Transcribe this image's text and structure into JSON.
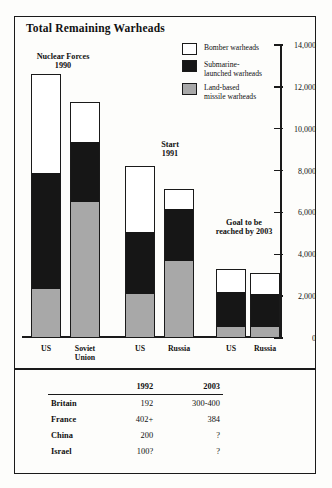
{
  "title": "Total Remaining Warheads",
  "legend": [
    {
      "key": "bomber",
      "label": "Bomber warheads",
      "swatch": "white",
      "color": "#ffffff"
    },
    {
      "key": "submarine",
      "label": "Submarine-\nlaunched warheads",
      "line1": "Submarine-",
      "line2": "launched warheads",
      "swatch": "black",
      "color": "#161616"
    },
    {
      "key": "landbased",
      "label": "Land-based\nmissile warheads",
      "line1": "Land-based",
      "line2": "missile warheads",
      "swatch": "gray",
      "color": "#a8a8a8"
    }
  ],
  "group_labels": [
    {
      "line1": "Nuclear Forces",
      "line2": "1990"
    },
    {
      "line1": "Start",
      "line2": "1991"
    },
    {
      "line1": "Goal to be",
      "line2": "reached by 2003"
    }
  ],
  "axis": {
    "ticks": [
      "14,000",
      "12,000",
      "10,000",
      "8,000",
      "6,000",
      "4,000",
      "2,000",
      "0"
    ],
    "min": 0,
    "max": 14000
  },
  "x_labels": [
    {
      "line1": "US",
      "line2": ""
    },
    {
      "line1": "Soviet",
      "line2": "Union"
    },
    {
      "line1": "US",
      "line2": ""
    },
    {
      "line1": "Russia",
      "line2": ""
    },
    {
      "line1": "US",
      "line2": ""
    },
    {
      "line1": "Russia",
      "line2": ""
    }
  ],
  "chart_data": {
    "type": "bar",
    "subtype": "stacked",
    "title": "Total Remaining Warheads",
    "xlabel": "",
    "ylabel": "",
    "ylim": [
      0,
      14000
    ],
    "ytick_values": [
      0,
      2000,
      4000,
      6000,
      8000,
      10000,
      12000,
      14000
    ],
    "ytick_labels": [
      "0",
      "2,000",
      "4,000",
      "6,000",
      "8,000",
      "10,000",
      "12,000",
      "14,000"
    ],
    "grid": false,
    "legend_position": "top-right",
    "categories": [
      "US",
      "Soviet Union",
      "US",
      "Russia",
      "US",
      "Russia"
    ],
    "group_annotations": [
      "Nuclear Forces 1990",
      "Nuclear Forces 1990",
      "Start 1991",
      "Start 1991",
      "Goal to be reached by 2003",
      "Goal to be reached by 2003"
    ],
    "series": [
      {
        "name": "Land-based missile warheads",
        "color": "#a8a8a8",
        "values": [
          2300,
          6500,
          2100,
          3700,
          500,
          500
        ]
      },
      {
        "name": "Submarine-launched warheads",
        "color": "#161616",
        "values": [
          5600,
          2900,
          3000,
          2500,
          1700,
          1600
        ]
      },
      {
        "name": "Bomber warheads",
        "color": "#ffffff",
        "values": [
          4700,
          1900,
          3100,
          900,
          1100,
          1000
        ]
      }
    ],
    "totals": [
      12600,
      11300,
      8200,
      7100,
      3300,
      3100
    ]
  },
  "table": {
    "headers": [
      "",
      "1992",
      "2003"
    ],
    "rows": [
      {
        "country": "Britain",
        "y1992": "192",
        "y2003": "300-400"
      },
      {
        "country": "France",
        "y1992": "402+",
        "y2003": "384"
      },
      {
        "country": "China",
        "y1992": "200",
        "y2003": "?"
      },
      {
        "country": "Israel",
        "y1992": "100?",
        "y2003": "?"
      }
    ]
  }
}
